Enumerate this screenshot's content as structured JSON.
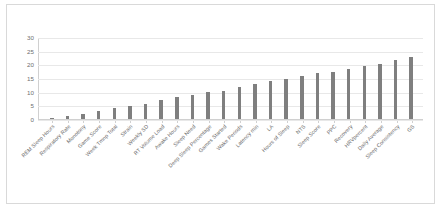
{
  "chart_data": {
    "type": "bar",
    "title": "",
    "xlabel": "",
    "ylabel": "",
    "ylim": [
      0,
      30
    ],
    "yticks": [
      0,
      5,
      10,
      15,
      20,
      25,
      30
    ],
    "grid": true,
    "legend": "none",
    "bar_color": "#7f7f7f",
    "grid_color": "#e8e8e8",
    "categories": [
      "REM Sleep Hours",
      "Respiratory Rate",
      "Monotony",
      "Game Score",
      "Week Tmnp Total",
      "Strain",
      "Weekly SD",
      "RT Volume Load",
      "Awake Hours",
      "Sleep Need",
      "Deep Sleep Percentage",
      "Games Started",
      "Wake Periods",
      "Latency min",
      "LA",
      "Hours of Sleep",
      "NTS",
      "Sleep Score",
      "PPC",
      "Recovery",
      "HRVpercent",
      "Daily Average",
      "Sleep Consistency",
      "GS"
    ],
    "values": [
      0.5,
      1,
      2,
      3,
      4,
      5,
      5.5,
      7,
      8,
      9,
      10,
      10.5,
      12,
      13,
      14,
      15,
      16,
      17,
      17.5,
      18.5,
      19.5,
      20.5,
      22,
      23
    ]
  }
}
